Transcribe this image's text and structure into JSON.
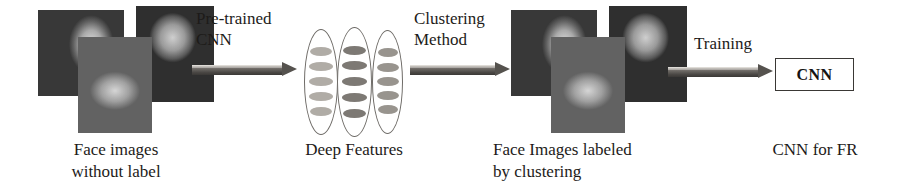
{
  "figure": {
    "type": "pipeline-diagram",
    "background_color": "#ffffff",
    "width": 899,
    "height": 194
  },
  "stages": {
    "input_images": {
      "caption": "Face images\nwithout label",
      "photo_count": 3,
      "photos": [
        {
          "name": "face-photo-suited-man-window",
          "tone": "grayscale"
        },
        {
          "name": "face-photo-person-with-cap",
          "tone": "grayscale"
        },
        {
          "name": "face-photo-man-suit-tie",
          "tone": "grayscale"
        }
      ]
    },
    "deep_features": {
      "caption": "Deep Features",
      "layer_count": 3,
      "nodes_per_layer": 5,
      "layers": [
        {
          "name": "feature-layer-1",
          "node_color": "#b0aca6"
        },
        {
          "name": "feature-layer-2",
          "node_color": "#7d7974"
        },
        {
          "name": "feature-layer-3",
          "node_color": "#98948e"
        }
      ]
    },
    "labeled_images": {
      "caption": "Face Images labeled\nby clustering",
      "photo_count": 3,
      "photos": [
        {
          "name": "face-photo-suited-man-window",
          "tone": "grayscale"
        },
        {
          "name": "face-photo-person-with-cap",
          "tone": "grayscale"
        },
        {
          "name": "face-photo-man-suit-tie",
          "tone": "grayscale"
        }
      ]
    },
    "output_model": {
      "box_label": "CNN",
      "caption": "CNN for FR"
    }
  },
  "arrows": [
    {
      "name": "arrow-pre-trained-cnn",
      "label": "Pre-trained\nCNN"
    },
    {
      "name": "arrow-clustering-method",
      "label": "Clustering\nMethod"
    },
    {
      "name": "arrow-training",
      "label": "Training"
    }
  ],
  "colors": {
    "arrow_shaft_dark": "#55524e",
    "arrow_shaft_light": "#c9c6c1",
    "ellipse_outline": "#6f6c68",
    "text": "#1d1b19",
    "box_border": "#3a3835"
  }
}
